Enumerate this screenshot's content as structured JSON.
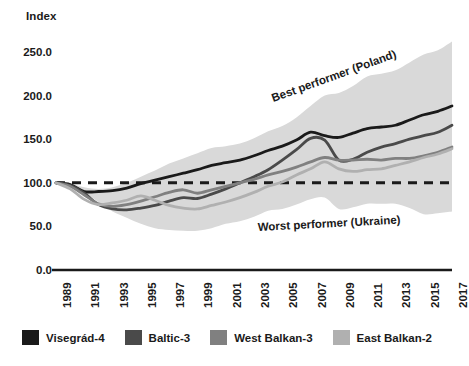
{
  "chart_data": {
    "type": "line",
    "title": "",
    "ylabel": "Index",
    "xlabel": "",
    "ylim": [
      0,
      250
    ],
    "xlim": [
      1989,
      2017
    ],
    "grid": false,
    "legend_position": "bottom",
    "y_ticks": [
      "0.0",
      "50.0",
      "100.0",
      "150.0",
      "200.0",
      "250.0"
    ],
    "y_tick_values": [
      0,
      50,
      100,
      150,
      200,
      250
    ],
    "x_tick_labels": [
      "1989",
      "1991",
      "1993",
      "1995",
      "1997",
      "1999",
      "2001",
      "2003",
      "2005",
      "2007",
      "2009",
      "2011",
      "2013",
      "2015",
      "2017"
    ],
    "x": [
      1989,
      1990,
      1991,
      1992,
      1993,
      1994,
      1995,
      1996,
      1997,
      1998,
      1999,
      2000,
      2001,
      2002,
      2003,
      2004,
      2005,
      2006,
      2007,
      2008,
      2009,
      2010,
      2011,
      2012,
      2013,
      2014,
      2015,
      2016,
      2017
    ],
    "reference_line": {
      "value": 100,
      "style": "dashed",
      "color": "#1a1a1a"
    },
    "band": {
      "label": "Range between best and worst performer",
      "color": "#d9d9d9",
      "upper_name": "Best performer (Poland)",
      "lower_name": "Worst performer (Ukraine)",
      "upper": [
        100,
        99,
        95,
        93,
        95,
        100,
        107,
        114,
        122,
        128,
        134,
        140,
        142,
        145,
        151,
        159,
        165,
        175,
        188,
        200,
        203,
        211,
        222,
        225,
        229,
        238,
        247,
        252,
        262
      ],
      "lower": [
        100,
        97,
        88,
        78,
        67,
        60,
        53,
        48,
        46,
        45,
        45,
        48,
        53,
        56,
        61,
        68,
        70,
        75,
        81,
        83,
        70,
        72,
        76,
        76,
        76,
        71,
        64,
        65,
        67
      ]
    },
    "series": [
      {
        "name": "Visegrád-4",
        "color": "#1a1a1a",
        "values": [
          100,
          98,
          90,
          90,
          91,
          94,
          99,
          103,
          107,
          111,
          115,
          120,
          123,
          126,
          131,
          137,
          142,
          149,
          158,
          154,
          152,
          157,
          162,
          164,
          166,
          172,
          178,
          182,
          188
        ]
      },
      {
        "name": "Baltic-3",
        "color": "#4a4a4a",
        "values": [
          100,
          97,
          88,
          75,
          70,
          69,
          71,
          74,
          79,
          83,
          82,
          87,
          93,
          100,
          107,
          115,
          126,
          138,
          151,
          149,
          126,
          127,
          135,
          141,
          145,
          150,
          154,
          158,
          166
        ]
      },
      {
        "name": "West Balkan-3",
        "color": "#808080",
        "values": [
          100,
          96,
          86,
          76,
          73,
          75,
          79,
          84,
          89,
          92,
          88,
          92,
          96,
          100,
          104,
          109,
          113,
          118,
          124,
          129,
          126,
          126,
          127,
          126,
          128,
          128,
          131,
          135,
          141
        ]
      },
      {
        "name": "East Balkan-2",
        "color": "#b0b0b0",
        "values": [
          100,
          93,
          81,
          75,
          77,
          80,
          85,
          80,
          74,
          71,
          70,
          74,
          78,
          83,
          89,
          96,
          101,
          109,
          116,
          124,
          116,
          113,
          115,
          116,
          120,
          124,
          129,
          133,
          139
        ]
      }
    ],
    "annotations": [
      {
        "text": "Best performer (Poland)",
        "target": "band-upper"
      },
      {
        "text": "Worst performer (Ukraine)",
        "target": "band-lower"
      }
    ]
  }
}
